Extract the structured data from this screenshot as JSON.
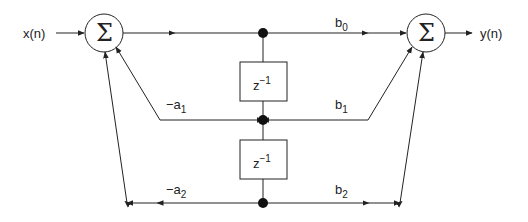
{
  "diagram": {
    "type": "direct-form-II biquad IIR filter",
    "input_label": "x(n)",
    "output_label": "y(n)",
    "summer_symbol": "Σ",
    "delay_label_base": "z",
    "delay_label_exp": "−1",
    "coefficients": {
      "b0": {
        "base": "b",
        "sub": "0"
      },
      "b1": {
        "base": "b",
        "sub": "1"
      },
      "b2": {
        "base": "b",
        "sub": "2"
      },
      "a1": {
        "base": "−a",
        "sub": "1"
      },
      "a2": {
        "base": "−a",
        "sub": "2"
      }
    },
    "colors": {
      "line": "#222222",
      "background": "#ffffff"
    }
  }
}
